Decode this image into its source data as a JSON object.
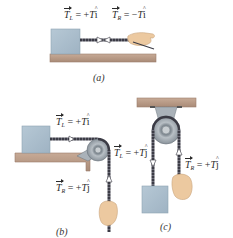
{
  "panels": {
    "a": {
      "caption": "(a)",
      "left_label": {
        "symbol": "T",
        "subscript": "L",
        "equals": "= +",
        "magnitude": "T",
        "unit": "i"
      },
      "right_label": {
        "symbol": "T",
        "subscript": "R",
        "equals": "= −",
        "magnitude": "T",
        "unit": "i"
      }
    },
    "b": {
      "caption": "(b)",
      "left_label": {
        "symbol": "T",
        "subscript": "L",
        "equals": "= +",
        "magnitude": "T",
        "unit": "i"
      },
      "right_label": {
        "symbol": "T",
        "subscript": "R",
        "equals": "= +",
        "magnitude": "T",
        "unit": "j"
      }
    },
    "c": {
      "caption": "(c)",
      "left_label": {
        "symbol": "T",
        "subscript": "L",
        "equals": "= +",
        "magnitude": "T",
        "unit": "j"
      },
      "right_label": {
        "symbol": "T",
        "subscript": "R",
        "equals": "= +",
        "magnitude": "T",
        "unit": "j"
      }
    }
  },
  "colors": {
    "block": "#a9bdcc",
    "block_edge": "#8ea3b3",
    "surface": "#b89a86",
    "surface_edge": "#9c7e6b",
    "rope": "#3b3b45",
    "pulley": "#9aa3ab",
    "pulley_dark": "#6b747c",
    "hand": "#ecc9a0",
    "hand_edge": "#c9a57c",
    "arrow": "#ffffff",
    "text": "#2b2b2b"
  }
}
